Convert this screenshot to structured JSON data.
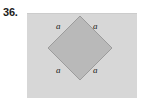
{
  "figure": {
    "problem_number": "36.",
    "panel": {
      "fill_color": "#d7d7d7",
      "x": 27,
      "y": 13,
      "width": 110,
      "height": 85
    },
    "diamond": {
      "name": "square-rotated-45",
      "fill_color": "#b9b9b9",
      "stroke_color": "#9a9a9a",
      "vertices": [
        {
          "x": 80,
          "y": 16
        },
        {
          "x": 112,
          "y": 48
        },
        {
          "x": 80,
          "y": 80
        },
        {
          "x": 48,
          "y": 48
        }
      ]
    },
    "side_labels": [
      {
        "id": "top-left",
        "text": "a"
      },
      {
        "id": "top-right",
        "text": "a"
      },
      {
        "id": "bottom-left",
        "text": "a"
      },
      {
        "id": "bottom-right",
        "text": "a"
      }
    ]
  }
}
